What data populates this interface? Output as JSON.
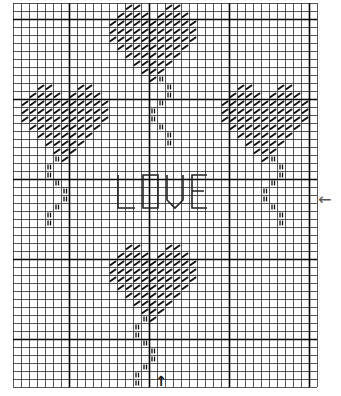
{
  "pattern": {
    "title_text": "LOVE",
    "grid": {
      "cols": 38,
      "rows": 48,
      "cell": 8,
      "origin_x": 13,
      "origin_y": 3,
      "thick_cols": [
        7,
        17,
        27,
        37
      ],
      "thick_rows": [
        2,
        12,
        22,
        32,
        42
      ],
      "line_color": "#2a2a2a",
      "thick_color": "#000000"
    },
    "symbols": {
      "half_stitch": "diagonal-slash",
      "stem_stitch": "double-bar"
    },
    "heart_shape": [
      [
        2,
        3,
        7,
        8
      ],
      [
        1,
        2,
        3,
        4,
        6,
        7,
        8,
        9
      ],
      [
        0,
        1,
        2,
        3,
        4,
        5,
        6,
        7,
        8,
        9,
        10
      ],
      [
        0,
        1,
        2,
        3,
        4,
        5,
        6,
        7,
        8,
        9,
        10
      ],
      [
        0,
        1,
        2,
        3,
        4,
        5,
        6,
        7,
        8,
        9,
        10
      ],
      [
        1,
        2,
        3,
        4,
        5,
        6,
        7,
        8,
        9
      ],
      [
        2,
        3,
        4,
        5,
        6,
        7,
        8
      ],
      [
        3,
        4,
        5,
        6,
        7
      ],
      [
        4,
        5,
        6
      ],
      [
        5
      ]
    ],
    "hearts": [
      {
        "name": "top-heart",
        "col": 12,
        "row": 0
      },
      {
        "name": "left-heart",
        "col": 1,
        "row": 10
      },
      {
        "name": "right-heart",
        "col": 26,
        "row": 10
      },
      {
        "name": "bottom-heart",
        "col": 12,
        "row": 30
      }
    ],
    "stems": [
      {
        "name": "top-stem",
        "cells": [
          [
            18,
            9
          ],
          [
            19,
            10
          ],
          [
            19,
            11
          ],
          [
            18,
            12
          ],
          [
            17,
            13
          ],
          [
            17,
            14
          ],
          [
            18,
            15
          ],
          [
            19,
            16
          ],
          [
            19,
            17
          ]
        ]
      },
      {
        "name": "left-stem",
        "cells": [
          [
            5,
            19
          ],
          [
            4,
            20
          ],
          [
            4,
            21
          ],
          [
            5,
            22
          ],
          [
            6,
            23
          ],
          [
            6,
            24
          ],
          [
            5,
            25
          ],
          [
            4,
            26
          ],
          [
            4,
            27
          ]
        ]
      },
      {
        "name": "right-stem",
        "cells": [
          [
            32,
            19
          ],
          [
            33,
            20
          ],
          [
            33,
            21
          ],
          [
            32,
            22
          ],
          [
            31,
            23
          ],
          [
            31,
            24
          ],
          [
            32,
            25
          ],
          [
            33,
            26
          ],
          [
            33,
            27
          ]
        ]
      },
      {
        "name": "bottom-stem",
        "cells": [
          [
            16,
            39
          ],
          [
            15,
            40
          ],
          [
            15,
            41
          ],
          [
            16,
            42
          ],
          [
            17,
            43
          ],
          [
            17,
            44
          ],
          [
            16,
            45
          ],
          [
            15,
            46
          ],
          [
            15,
            47
          ]
        ]
      }
    ],
    "center_marks": {
      "bottom_arrow": "↑",
      "side_arrow": "←"
    },
    "love_letters": {
      "color": "#222222",
      "paths": [
        "M118 175 L118 208 L135 208",
        "M143 175 L158 175 L158 208 L143 208 Z",
        "M167 175 L167 200 L175 208 L183 200 L183 175",
        "M207 175 L192 175 L192 208 L207 208 M192 191 L204 191"
      ]
    }
  }
}
